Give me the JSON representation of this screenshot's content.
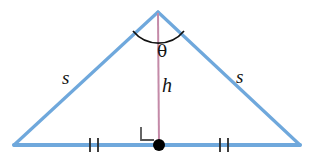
{
  "figure": {
    "name": "isosceles-triangle-with-altitude",
    "background_color": "#ffffff"
  },
  "colors": {
    "triangle_stroke": "#6FA8DC",
    "triangle_stroke_dark": "#5B9BD5",
    "altitude_stroke": "#C48AA8",
    "arc_stroke": "#111111",
    "right_angle_stroke": "#555555",
    "tick_stroke": "#2A2A2A",
    "midpoint_dot": "#000000",
    "label_color": "#141414"
  },
  "geometry": {
    "apex": {
      "x": 158,
      "y": 12
    },
    "left_vertex": {
      "x": 14,
      "y": 145
    },
    "right_vertex": {
      "x": 300,
      "y": 145
    },
    "midpoint": {
      "x": 159,
      "y": 145
    },
    "triangle_stroke_width": 3.2,
    "altitude_stroke_width": 2,
    "dot_radius": 6,
    "arc": {
      "start_x": 133,
      "start_y": 31,
      "end_x": 184,
      "end_y": 31,
      "radius": 33
    },
    "right_angle_marker": {
      "x": 141,
      "y": 127,
      "size": 13
    },
    "ticks_left": [
      {
        "x": 90
      },
      {
        "x": 98
      }
    ],
    "ticks_right": [
      {
        "x": 220
      },
      {
        "x": 228
      }
    ],
    "tick_half_height": 7
  },
  "labels": {
    "side_left": "s",
    "side_right": "s",
    "height": "h",
    "apex_angle": "θ"
  }
}
